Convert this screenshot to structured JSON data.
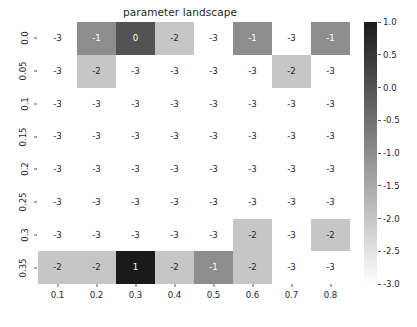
{
  "chart_data": {
    "type": "heatmap",
    "title": "parameter landscape",
    "xlabel": "",
    "ylabel": "",
    "x_tick_labels": [
      "0.1",
      "0.2",
      "0.3",
      "0.4",
      "0.5",
      "0.6",
      "0.7",
      "0.8"
    ],
    "y_tick_labels": [
      "0.0",
      "0.05",
      "0.1",
      "0.15",
      "0.2",
      "0.25",
      "0.3",
      "0.35"
    ],
    "x": [
      0.1,
      0.2,
      0.3,
      0.4,
      0.5,
      0.6,
      0.7,
      0.8
    ],
    "y": [
      0.0,
      0.05,
      0.1,
      0.15,
      0.2,
      0.25,
      0.3,
      0.35
    ],
    "values": [
      [
        -3,
        -1,
        0,
        -2,
        -3,
        -1,
        -3,
        -1
      ],
      [
        -3,
        -2,
        -3,
        -3,
        -3,
        -3,
        -2,
        -3
      ],
      [
        -3,
        -3,
        -3,
        -3,
        -3,
        -3,
        -3,
        -3
      ],
      [
        -3,
        -3,
        -3,
        -3,
        -3,
        -3,
        -3,
        -3
      ],
      [
        -3,
        -3,
        -3,
        -3,
        -3,
        -3,
        -3,
        -3
      ],
      [
        -3,
        -3,
        -3,
        -3,
        -3,
        -3,
        -3,
        -3
      ],
      [
        -3,
        -3,
        -3,
        -3,
        -3,
        -2,
        -3,
        -2
      ],
      [
        -2,
        -2,
        1,
        -2,
        -1,
        -2,
        -3,
        -3
      ]
    ],
    "annotations": [
      [
        "-3",
        "-1",
        "0",
        "-2",
        "-3",
        "-1",
        "-3",
        "-1"
      ],
      [
        "-3",
        "-2",
        "-3",
        "-3",
        "-3",
        "-3",
        "-2",
        "-3"
      ],
      [
        "-3",
        "-3",
        "-3",
        "-3",
        "-3",
        "-3",
        "-3",
        "-3"
      ],
      [
        "-3",
        "-3",
        "-3",
        "-3",
        "-3",
        "-3",
        "-3",
        "-3"
      ],
      [
        "-3",
        "-3",
        "-3",
        "-3",
        "-3",
        "-3",
        "-3",
        "-3"
      ],
      [
        "-3",
        "-3",
        "-3",
        "-3",
        "-3",
        "-3",
        "-3",
        "-3"
      ],
      [
        "-3",
        "-3",
        "-3",
        "-3",
        "-3",
        "-2",
        "-3",
        "-2"
      ],
      [
        "-2",
        "-2",
        "1",
        "-2",
        "-1",
        "-2",
        "-3",
        "-3"
      ]
    ],
    "colormap": "gray_r",
    "clim": [
      -3.0,
      1.0
    ],
    "colorbar": {
      "tick_labels": [
        "1.0",
        "0.5",
        "0.0",
        "-0.5",
        "-1.0",
        "-1.5",
        "-2.0",
        "-2.5",
        "-3.0"
      ],
      "tick_values": [
        1.0,
        0.5,
        0.0,
        -0.5,
        -1.0,
        -1.5,
        -2.0,
        -2.5,
        -3.0
      ],
      "orientation": "vertical",
      "position": "right",
      "top_color": "#1a1a1a",
      "bottom_color": "#ffffff"
    },
    "grid": false,
    "legend": null
  },
  "figure": {
    "background": "#ffffff",
    "text_color": "#262626"
  }
}
